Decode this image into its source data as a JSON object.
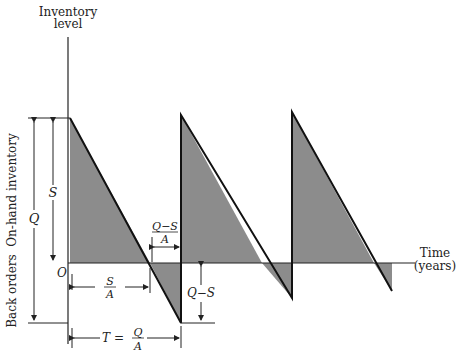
{
  "axes": {
    "y_label_line1": "Inventory",
    "y_label_line2": "level",
    "x_label_line1": "Time",
    "x_label_line2": "(years)",
    "origin": "O"
  },
  "side_labels": {
    "on_hand": "On-hand inventory",
    "back_orders": "Back orders"
  },
  "dimensions": {
    "Q": "Q",
    "S": "S",
    "S_over_A_num": "S",
    "S_over_A_den": "A",
    "QmS_over_A_num": "Q−S",
    "QmS_over_A_den": "A",
    "QmS": "Q−S",
    "T_prefix": "T =",
    "T_num": "Q",
    "T_den": "A"
  },
  "colors": {
    "shade": "#8c8c8c",
    "line": "#1a1a1a"
  }
}
